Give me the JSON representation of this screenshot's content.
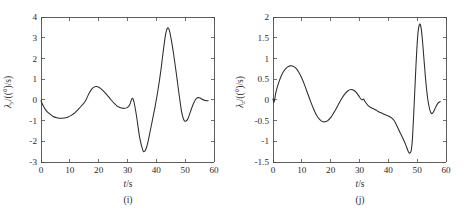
{
  "figure": {
    "background_color": "#ffffff",
    "curve_color": "#2b2b2b",
    "axis_color": "#4d4d4d",
    "panel_count": 2
  },
  "panels": [
    {
      "id": "panel-i",
      "caption": "(i)",
      "xlabel_var": "t",
      "xlabel_unit": "/s",
      "ylabel_var": "λ",
      "ylabel_sub": "y",
      "ylabel_unit": "/((°)/s)"
    },
    {
      "id": "panel-j",
      "caption": "(j)",
      "xlabel_var": "t",
      "xlabel_unit": "/s",
      "ylabel_var": "λ",
      "ylabel_sub": "z",
      "ylabel_unit": "/((°)/s)"
    }
  ],
  "chart_data": [
    {
      "type": "line",
      "panel": "(i)",
      "title": "",
      "xlabel": "t/s",
      "ylabel": "λ_y/((°)/s)",
      "xlim": [
        0,
        60
      ],
      "ylim": [
        -3,
        4
      ],
      "xticks": [
        0,
        10,
        20,
        30,
        40,
        50,
        60
      ],
      "xticklabels": [
        "0",
        "10",
        "20",
        "30",
        "40",
        "50",
        "60"
      ],
      "yticks": [
        -3,
        -2,
        -1,
        0,
        1,
        2,
        3,
        4
      ],
      "yticklabels": [
        "-3",
        "-2",
        "-1",
        "0",
        "1",
        "2",
        "3",
        "4"
      ],
      "grid": false,
      "legend": null,
      "series": [
        {
          "name": "lambda_y",
          "x": [
            0,
            0.8,
            1.8,
            3.0,
            4.2,
            5.5,
            6.8,
            8.0,
            9.2,
            10.5,
            11.8,
            13.0,
            14.2,
            15.4,
            16.6,
            17.8,
            19.0,
            20.2,
            21.5,
            22.8,
            24.0,
            25.2,
            26.4,
            27.6,
            28.8,
            30.0,
            30.8,
            31.3,
            31.8,
            32.4,
            33.2,
            34.2,
            35.2,
            35.8,
            36.6,
            37.6,
            38.6,
            39.6,
            40.6,
            41.6,
            42.4,
            43.2,
            43.8,
            44.4,
            45.2,
            46.0,
            47.0,
            48.0,
            48.8,
            49.6,
            50.2,
            51.0,
            52.0,
            53.0,
            54.0,
            55.0,
            56.0,
            57.0,
            58.0
          ],
          "y": [
            -0.05,
            -0.3,
            -0.52,
            -0.68,
            -0.8,
            -0.86,
            -0.89,
            -0.88,
            -0.84,
            -0.75,
            -0.62,
            -0.45,
            -0.26,
            -0.06,
            0.3,
            0.55,
            0.64,
            0.6,
            0.45,
            0.25,
            0.05,
            -0.14,
            -0.3,
            -0.38,
            -0.41,
            -0.36,
            -0.22,
            -0.02,
            0.07,
            -0.2,
            -0.85,
            -1.8,
            -2.38,
            -2.5,
            -2.3,
            -1.7,
            -1.0,
            -0.3,
            0.5,
            1.45,
            2.35,
            3.15,
            3.45,
            3.4,
            2.9,
            2.2,
            1.2,
            0.15,
            -0.6,
            -0.98,
            -1.03,
            -0.9,
            -0.5,
            -0.14,
            0.08,
            0.1,
            0.02,
            -0.03,
            -0.04
          ]
        }
      ]
    },
    {
      "type": "line",
      "panel": "(j)",
      "title": "",
      "xlabel": "t/s",
      "ylabel": "λ_z/((°)/s)",
      "xlim": [
        0,
        60
      ],
      "ylim": [
        -1.5,
        2
      ],
      "xticks": [
        0,
        10,
        20,
        30,
        40,
        50,
        60
      ],
      "xticklabels": [
        "0",
        "10",
        "20",
        "30",
        "40",
        "50",
        "60"
      ],
      "yticks": [
        -1.5,
        -1,
        -0.5,
        0,
        0.5,
        1,
        1.5,
        2
      ],
      "yticklabels": [
        "-1.5",
        "-1",
        "-0.5",
        "0",
        "0.5",
        "1",
        "1.5",
        "2"
      ],
      "grid": false,
      "legend": null,
      "series": [
        {
          "name": "lambda_z",
          "x": [
            0,
            0.4,
            1.0,
            2.0,
            3.0,
            4.0,
            5.0,
            6.0,
            7.0,
            8.0,
            9.0,
            10.0,
            11.0,
            12.0,
            13.0,
            14.0,
            15.0,
            16.0,
            17.0,
            18.0,
            19.0,
            20.0,
            21.0,
            22.0,
            23.0,
            24.0,
            25.0,
            26.0,
            27.0,
            28.0,
            29.0,
            30.0,
            30.8,
            31.4,
            32.0,
            33.0,
            34.0,
            35.0,
            36.0,
            37.0,
            38.0,
            39.0,
            40.0,
            41.0,
            42.0,
            43.0,
            44.0,
            45.0,
            46.0,
            47.0,
            47.6,
            48.0,
            48.4,
            49.0,
            49.6,
            50.2,
            50.8,
            51.4,
            52.0,
            52.8,
            53.6,
            54.4,
            55.0,
            55.6,
            56.4,
            57.2,
            58.0
          ],
          "y": [
            0.02,
            -0.05,
            0.18,
            0.42,
            0.6,
            0.72,
            0.79,
            0.82,
            0.81,
            0.76,
            0.66,
            0.52,
            0.35,
            0.16,
            -0.03,
            -0.21,
            -0.36,
            -0.46,
            -0.52,
            -0.53,
            -0.5,
            -0.43,
            -0.32,
            -0.2,
            -0.07,
            0.05,
            0.15,
            0.22,
            0.25,
            0.23,
            0.17,
            0.07,
            0.0,
            0.02,
            -0.05,
            -0.14,
            -0.19,
            -0.22,
            -0.26,
            -0.3,
            -0.33,
            -0.36,
            -0.39,
            -0.43,
            -0.5,
            -0.63,
            -0.78,
            -0.92,
            -1.08,
            -1.26,
            -1.28,
            -1.2,
            -0.9,
            -0.05,
            0.85,
            1.55,
            1.82,
            1.72,
            1.3,
            0.6,
            0.05,
            -0.25,
            -0.33,
            -0.3,
            -0.18,
            -0.08,
            -0.04
          ]
        }
      ]
    }
  ]
}
